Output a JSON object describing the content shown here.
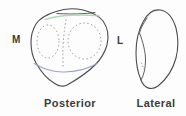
{
  "figure": {
    "left_marker": "M",
    "right_marker": "L",
    "left_caption": "Posterior",
    "right_caption": "Lateral"
  },
  "colors": {
    "background": "#fdfdfd",
    "outline": "#4b4b4b",
    "dots": "#8c948c",
    "green_line": "#a8d8a8",
    "blue_line": "#9097c8",
    "text": "#3c3c3c"
  }
}
